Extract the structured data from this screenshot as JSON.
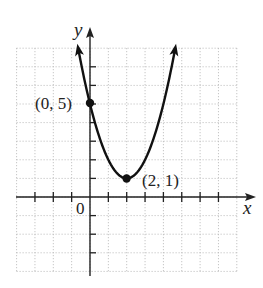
{
  "chart_data": {
    "type": "line",
    "title": "",
    "equation_implied": "y = (x - 2)^2 + 1",
    "xlabel": "x",
    "ylabel": "y",
    "origin_label": "0",
    "xlim": [
      -4,
      8
    ],
    "ylim": [
      -4,
      8
    ],
    "grid": true,
    "grid_step": 1,
    "series": [
      {
        "name": "parabola",
        "x": [
          -0.65,
          0,
          1,
          2,
          3,
          4,
          4.65
        ],
        "y": [
          8,
          5,
          2,
          1,
          2,
          5,
          8
        ]
      }
    ],
    "points": [
      {
        "x": 0,
        "y": 5,
        "label": "(0, 5)"
      },
      {
        "x": 2,
        "y": 1,
        "label": "(2, 1)"
      }
    ]
  },
  "labels": {
    "x_axis": "x",
    "y_axis": "y",
    "origin": "0",
    "point_a": "(0, 5)",
    "point_b": "(2, 1)"
  }
}
